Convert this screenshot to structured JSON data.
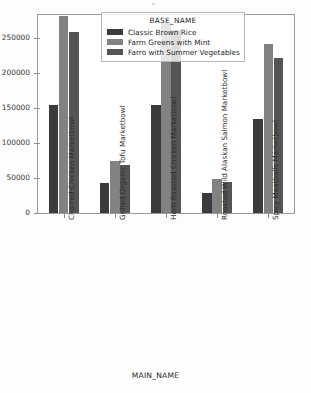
{
  "chart_data": {
    "type": "bar",
    "title": "",
    "xlabel": "MAIN_NAME",
    "ylabel": "",
    "legend_title": "BASE_NAME",
    "legend_position": "upper center",
    "grid": false,
    "ylim": [
      0,
      283000
    ],
    "yticks": [
      0,
      50000,
      100000,
      150000,
      200000,
      250000
    ],
    "ytick_labels": [
      "0",
      "50000",
      "100000",
      "150000",
      "200000",
      "250000"
    ],
    "categories": [
      "Charred Chicken Marketbowl",
      "Grilled Organic Tofu Marketbowl",
      "Herb Roasted Chicken Marketbowl",
      "Roasted Wild Alaskan Salmon Marketbowl",
      "Spicy Meatballs Marketbowl"
    ],
    "series": [
      {
        "name": "Classic Brown Rice",
        "color": "#3b3b3b",
        "values": [
          155000,
          43000,
          155000,
          28000,
          134000
        ]
      },
      {
        "name": "Farm Greens with Mint",
        "color": "#828282",
        "values": [
          281000,
          74000,
          272000,
          48000,
          241000
        ]
      },
      {
        "name": "Farro with Summer Vegetables",
        "color": "#555555",
        "values": [
          259000,
          68000,
          262000,
          45000,
          222000
        ]
      }
    ]
  }
}
